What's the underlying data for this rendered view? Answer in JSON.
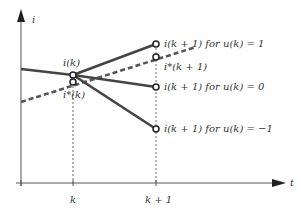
{
  "axes": {
    "y_label": "i",
    "x_label": "t",
    "x_ticks": [
      {
        "label": "k",
        "x": 73
      },
      {
        "label": "k + 1",
        "x": 156
      }
    ]
  },
  "points": {
    "ik": {
      "label": "i(k)",
      "x": 73,
      "y": 75
    },
    "istar_k": {
      "label": "i*(k)",
      "x": 73,
      "y": 82
    },
    "ik1_u1": {
      "label": "i(k + 1)  for u(k) = 1",
      "x": 156,
      "y": 44
    },
    "istar_k1": {
      "label": "i*(k + 1)",
      "x": 156,
      "y": 57
    },
    "ik1_u0": {
      "label": "i(k + 1)  for u(k) = 0",
      "x": 156,
      "y": 87
    },
    "ik1_um1": {
      "label": "i(k + 1)  for u(k) = −1",
      "x": 156,
      "y": 129
    }
  },
  "colors": {
    "line": "#444444",
    "axis": "#555555",
    "background": "#ffffff"
  }
}
